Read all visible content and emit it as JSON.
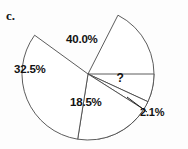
{
  "figure": {
    "item_label": "c.",
    "background_color": "#fdfdfd",
    "stroke_color": "#4a4a4a",
    "text_color": "#121212"
  },
  "chart_data": {
    "type": "pie",
    "title": "",
    "xlabel": "",
    "ylabel": "",
    "legend_position": "none",
    "grid": false,
    "units": "percent",
    "center": {
      "x": 88,
      "y": 74
    },
    "radius": 66,
    "start_angle_deg": 0,
    "direction": "clockwise",
    "categories": [
      "40.0%",
      "?",
      "2.1%",
      "18.5%",
      "32.5%"
    ],
    "labels": [
      "40.0%",
      "?",
      "2.1%",
      "18.5%",
      "32.5%"
    ],
    "values": [
      40.0,
      6.9,
      2.1,
      18.5,
      32.5
    ],
    "unknown_slice": {
      "label": "?",
      "implied_value": 6.9,
      "note": "value not printed on chart"
    },
    "slices": [
      {
        "label": "40.0%",
        "value": 40.0,
        "start_deg": 297,
        "end_deg": 441,
        "label_x": 82,
        "label_y": 40,
        "fill": "#ffffff",
        "callout": false
      },
      {
        "label": "?",
        "value": 6.9,
        "start_deg": 0,
        "end_deg": 24.8,
        "label_x": 120,
        "label_y": 78,
        "fill": "#ffffff",
        "callout": false
      },
      {
        "label": "2.1%",
        "value": 2.1,
        "start_deg": 24.8,
        "end_deg": 32.4,
        "label_x": 152,
        "label_y": 112,
        "fill": "#ffffff",
        "callout": true,
        "leader_from": {
          "x": 147,
          "y": 112
        },
        "leader_to": {
          "x": 127,
          "y": 97
        }
      },
      {
        "label": "18.5%",
        "value": 18.5,
        "start_deg": 32.4,
        "end_deg": 99,
        "label_x": 86,
        "label_y": 103,
        "fill": "#ffffff",
        "callout": false
      },
      {
        "label": "32.5%",
        "value": 32.5,
        "start_deg": 99,
        "end_deg": 216,
        "label_x": 30,
        "label_y": 70,
        "fill": "#ffffff",
        "callout": false
      }
    ]
  }
}
